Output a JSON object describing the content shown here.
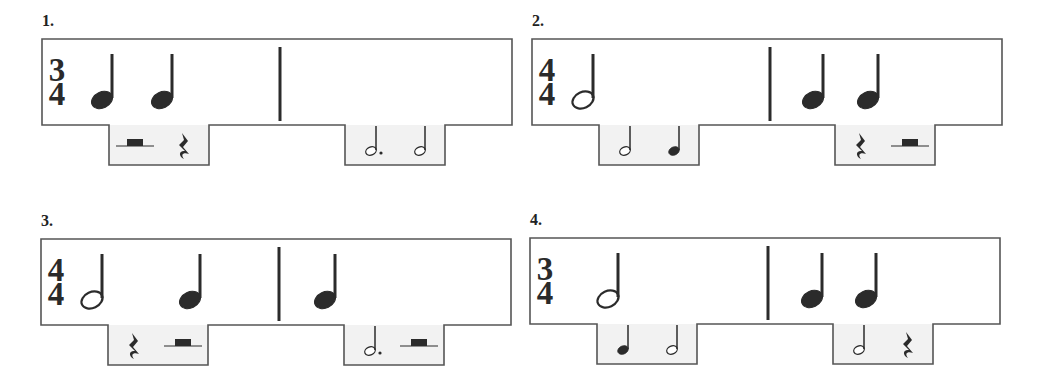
{
  "colors": {
    "outline": "#555555",
    "tab_fill": "#f2f2f2",
    "ink": "#2b2b2b",
    "background": "#ffffff"
  },
  "exercises": [
    {
      "number": "1.",
      "time_signature": {
        "top": "3",
        "bottom": "4"
      },
      "measures": [
        {
          "notes": [
            {
              "type": "quarter",
              "x": 60
            },
            {
              "type": "quarter",
              "x": 120
            }
          ]
        },
        {
          "notes": []
        }
      ],
      "answer_options": [
        {
          "choices": [
            "half-rest",
            "quarter-rest"
          ]
        },
        {
          "choices": [
            "dotted-half-note",
            "half-note"
          ]
        }
      ]
    },
    {
      "number": "2.",
      "time_signature": {
        "top": "4",
        "bottom": "4"
      },
      "measures": [
        {
          "notes": [
            {
              "type": "half",
              "x": 51
            }
          ]
        },
        {
          "notes": [
            {
              "type": "quarter",
              "x": 281
            },
            {
              "type": "quarter",
              "x": 336
            }
          ]
        }
      ],
      "answer_options": [
        {
          "choices": [
            "half-note",
            "quarter-note"
          ]
        },
        {
          "choices": [
            "quarter-rest",
            "half-rest"
          ]
        }
      ]
    },
    {
      "number": "3.",
      "time_signature": {
        "top": "4",
        "bottom": "4"
      },
      "measures": [
        {
          "notes": [
            {
              "type": "half",
              "x": 51
            },
            {
              "type": "quarter",
              "x": 149
            }
          ]
        },
        {
          "notes": [
            {
              "type": "quarter",
              "x": 284
            }
          ]
        }
      ],
      "answer_options": [
        {
          "choices": [
            "quarter-rest",
            "half-rest"
          ]
        },
        {
          "choices": [
            "dotted-half-note",
            "half-rest"
          ]
        }
      ]
    },
    {
      "number": "4.",
      "time_signature": {
        "top": "3",
        "bottom": "4"
      },
      "measures": [
        {
          "notes": [
            {
              "type": "half",
              "x": 78
            }
          ]
        },
        {
          "notes": [
            {
              "type": "quarter",
              "x": 282
            },
            {
              "type": "quarter",
              "x": 336
            }
          ]
        }
      ],
      "answer_options": [
        {
          "choices": [
            "quarter-note",
            "half-note"
          ]
        },
        {
          "choices": [
            "half-note",
            "quarter-rest"
          ]
        }
      ]
    }
  ]
}
